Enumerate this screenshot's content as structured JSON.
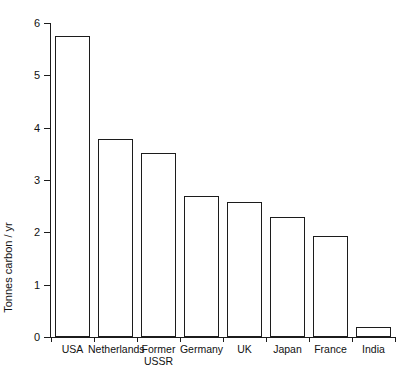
{
  "chart_data": {
    "type": "bar",
    "title": "",
    "subtitle": "",
    "xlabel": "",
    "ylabel": "Tonnes carbon / yr",
    "categories": [
      "USA",
      "Netherlands",
      "Former\nUSSR",
      "Germany",
      "UK",
      "Japan",
      "France",
      "India"
    ],
    "values": [
      5.75,
      3.78,
      3.51,
      2.69,
      2.58,
      2.3,
      1.93,
      0.19
    ],
    "ylim": [
      0,
      6
    ],
    "yticks": [
      0,
      1,
      2,
      3,
      4,
      5,
      6
    ],
    "ytick_labels": [
      "0",
      "1",
      "2",
      "3",
      "4",
      "5",
      "6"
    ],
    "grid": false,
    "legend": false,
    "legend_position": "none",
    "bar_fill_color": "#ffffff",
    "bar_edge_color": "#1c1c1c",
    "axis_color": "#1c1c1c",
    "background_color": "#ffffff"
  }
}
